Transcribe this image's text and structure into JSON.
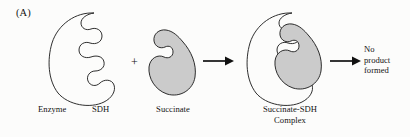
{
  "figure": {
    "panel_label": "(A)",
    "background_color": "#fcfcfb",
    "ink_color": "#171717",
    "substrate_fill_color": "#cbcbcb",
    "operator_plus": "+",
    "captions": {
      "enzyme": "Enzyme",
      "enzyme_abbrev": "SDH",
      "substrate": "Succinate",
      "complex_line1": "Succinate-SDH",
      "complex_line2": "Complex"
    },
    "outcome": {
      "line1": "No",
      "line2": "product",
      "line3": "formed"
    },
    "icons": {
      "enzyme": "enzyme-blob-icon",
      "substrate": "substrate-blob-icon",
      "complex": "enzyme-substrate-complex-icon",
      "arrow_1": "right-arrow-icon",
      "arrow_2": "right-arrow-icon",
      "plus": "plus-icon"
    }
  }
}
